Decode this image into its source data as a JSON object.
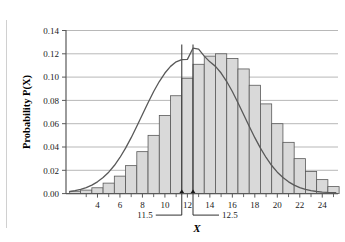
{
  "chart_data": {
    "type": "bar",
    "title": "",
    "subtitle": "",
    "xlabel": "X",
    "ylabel": "Probability P(X)",
    "xlim": [
      1.2,
      25.4
    ],
    "ylim": [
      0.0,
      0.14
    ],
    "grid": true,
    "legend": null,
    "y_ticks": [
      "0.00",
      "0.02",
      "0.04",
      "0.06",
      "0.08",
      "0.10",
      "0.12",
      "0.14"
    ],
    "y_tick_values": [
      0.0,
      0.02,
      0.04,
      0.06,
      0.08,
      0.1,
      0.12,
      0.14
    ],
    "x_ticks": [
      "4",
      "6",
      "8",
      "10",
      "12",
      "14",
      "16",
      "18",
      "20",
      "22",
      "24"
    ],
    "x_tick_values": [
      4,
      6,
      8,
      10,
      12,
      14,
      16,
      18,
      20,
      22,
      24
    ],
    "x_minor_tick_values": [
      3,
      5,
      7,
      9,
      11,
      13,
      15,
      17,
      19,
      21,
      23,
      25
    ],
    "bar_color": "#d9d9d9",
    "bar_edge_color": "#595959",
    "curve_color": "#595959",
    "marker_line_color": "#404040",
    "categories": [
      2,
      3,
      4,
      5,
      6,
      7,
      8,
      9,
      10,
      11,
      12,
      13,
      14,
      15,
      16,
      17,
      18,
      19,
      20,
      21,
      22,
      23,
      24,
      25
    ],
    "values": [
      0.002,
      0.003,
      0.005,
      0.009,
      0.015,
      0.024,
      0.036,
      0.05,
      0.067,
      0.084,
      0.099,
      0.111,
      0.118,
      0.12,
      0.116,
      0.107,
      0.093,
      0.077,
      0.06,
      0.044,
      0.03,
      0.019,
      0.012,
      0.006
    ],
    "curve_points": [
      [
        1.6,
        0.0018
      ],
      [
        2.0,
        0.0025
      ],
      [
        2.5,
        0.0036
      ],
      [
        3.0,
        0.0052
      ],
      [
        3.5,
        0.0073
      ],
      [
        4.0,
        0.0101
      ],
      [
        4.5,
        0.0138
      ],
      [
        5.0,
        0.0184
      ],
      [
        5.5,
        0.0241
      ],
      [
        6.0,
        0.031
      ],
      [
        6.5,
        0.039
      ],
      [
        7.0,
        0.048
      ],
      [
        7.5,
        0.0578
      ],
      [
        8.0,
        0.0679
      ],
      [
        8.5,
        0.078
      ],
      [
        9.0,
        0.0876
      ],
      [
        9.5,
        0.0962
      ],
      [
        10.0,
        0.1035
      ],
      [
        10.5,
        0.1092
      ],
      [
        11.0,
        0.1131
      ],
      [
        11.5,
        0.115
      ],
      [
        12.0,
        0.1152
      ],
      [
        12.5,
        0.1248
      ],
      [
        13.0,
        0.124
      ],
      [
        13.5,
        0.118
      ],
      [
        14.0,
        0.1131
      ],
      [
        14.5,
        0.1092
      ],
      [
        15.0,
        0.1035
      ],
      [
        15.5,
        0.0962
      ],
      [
        16.0,
        0.0876
      ],
      [
        16.5,
        0.078
      ],
      [
        17.0,
        0.0679
      ],
      [
        17.5,
        0.0578
      ],
      [
        18.0,
        0.048
      ],
      [
        18.5,
        0.039
      ],
      [
        19.0,
        0.031
      ],
      [
        19.5,
        0.0241
      ],
      [
        20.0,
        0.0184
      ],
      [
        20.5,
        0.0138
      ],
      [
        21.0,
        0.0101
      ],
      [
        21.5,
        0.0073
      ],
      [
        22.0,
        0.0052
      ],
      [
        22.5,
        0.0036
      ],
      [
        23.0,
        0.0025
      ],
      [
        23.5,
        0.0018
      ],
      [
        24.0,
        0.0013
      ],
      [
        24.5,
        0.001
      ],
      [
        25.2,
        0.0008
      ]
    ],
    "annotations": [
      {
        "label": "11.5",
        "value": 11.5
      },
      {
        "label": "12.5",
        "value": 12.5
      }
    ]
  }
}
